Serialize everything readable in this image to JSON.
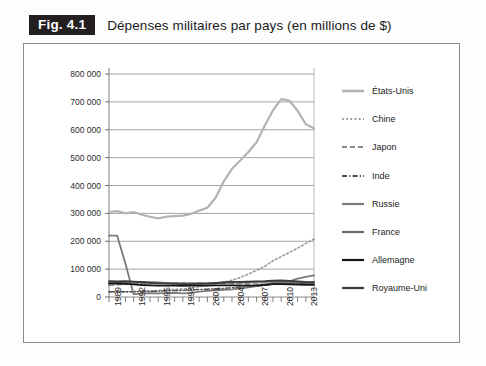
{
  "figure": {
    "badge": "Fig. 4.1",
    "title": "Dépenses militaires par pays (en millions de $)"
  },
  "chart_data": {
    "type": "line",
    "title": "Dépenses militaires par pays (en millions de $)",
    "xlabel": "",
    "ylabel": "",
    "xlim": [
      1989,
      2014
    ],
    "ylim": [
      0,
      800000
    ],
    "grid": true,
    "legend_position": "right",
    "ytick_labels": [
      "800 000",
      "700 000",
      "600 000",
      "500 000",
      "400 000",
      "300 000",
      "200 000",
      "100 000",
      "0"
    ],
    "ytick_values": [
      800000,
      700000,
      600000,
      500000,
      400000,
      300000,
      200000,
      100000,
      0
    ],
    "xtick_labels": [
      "1989",
      "1992",
      "1995",
      "1998",
      "2001",
      "2004",
      "2007",
      "2010",
      "2013"
    ],
    "xtick_values": [
      1989,
      1992,
      1995,
      1998,
      2001,
      2004,
      2007,
      2010,
      2013
    ],
    "x": [
      1989,
      1990,
      1991,
      1992,
      1993,
      1994,
      1995,
      1996,
      1997,
      1998,
      1999,
      2000,
      2001,
      2002,
      2003,
      2004,
      2005,
      2006,
      2007,
      2008,
      2009,
      2010,
      2011,
      2012,
      2013,
      2014
    ],
    "series": [
      {
        "name": "États-Unis",
        "color": "#b3b3b3",
        "style": "solid",
        "width": 2.2,
        "values": [
          305000,
          308000,
          300000,
          305000,
          295000,
          288000,
          282000,
          288000,
          290000,
          292000,
          298000,
          310000,
          320000,
          356000,
          415000,
          460000,
          490000,
          520000,
          555000,
          615000,
          670000,
          710000,
          705000,
          668000,
          620000,
          605000
        ]
      },
      {
        "name": "Chine",
        "color": "#9a9a9a",
        "style": "dotted",
        "width": 1.6,
        "values": [
          17000,
          17500,
          18000,
          19500,
          21000,
          22000,
          23000,
          25000,
          27000,
          29000,
          33000,
          37000,
          42000,
          48000,
          53000,
          60000,
          70000,
          82000,
          96000,
          110000,
          130000,
          145000,
          160000,
          175000,
          192000,
          208000
        ]
      },
      {
        "name": "Japon",
        "color": "#8a8a8a",
        "style": "dashed",
        "width": 1.6,
        "values": [
          42000,
          44000,
          46000,
          47000,
          48000,
          48500,
          49000,
          49500,
          50000,
          50000,
          49500,
          49000,
          48500,
          48500,
          48500,
          48000,
          47500,
          47000,
          46500,
          46000,
          47000,
          47500,
          47000,
          46500,
          46000,
          45500
        ]
      },
      {
        "name": "Inde",
        "color": "#4a4a4a",
        "style": "dashdot",
        "width": 1.4,
        "values": [
          19000,
          19500,
          19000,
          18500,
          20000,
          20000,
          21000,
          22000,
          23000,
          23500,
          26000,
          27000,
          28000,
          30000,
          31000,
          33000,
          35000,
          36000,
          38000,
          42000,
          47000,
          49000,
          49500,
          48000,
          48500,
          50000
        ]
      },
      {
        "name": "Russie",
        "color": "#7a7a7a",
        "style": "solid",
        "width": 1.8,
        "values": [
          220000,
          220000,
          120000,
          10000,
          12000,
          14000,
          13000,
          14000,
          15000,
          13000,
          15000,
          19000,
          22000,
          24000,
          26000,
          27000,
          31000,
          35000,
          40000,
          45000,
          51000,
          52000,
          56000,
          66000,
          72000,
          78000
        ]
      },
      {
        "name": "France",
        "color": "#6e6e6e",
        "style": "solid",
        "width": 1.8,
        "values": [
          52000,
          53000,
          53000,
          54000,
          54000,
          53000,
          52000,
          51000,
          50000,
          49000,
          49000,
          49500,
          50000,
          51000,
          52000,
          53000,
          53000,
          53500,
          54000,
          54000,
          56000,
          55000,
          54000,
          53000,
          52500,
          52000
        ]
      },
      {
        "name": "Allemagne",
        "color": "#151515",
        "style": "solid",
        "width": 1.8,
        "values": [
          48000,
          48500,
          47000,
          45000,
          43000,
          42000,
          41000,
          41000,
          40500,
          40000,
          41000,
          41500,
          41000,
          42000,
          42000,
          41500,
          41000,
          41000,
          41500,
          43000,
          46000,
          46500,
          45000,
          44500,
          44000,
          43500
        ]
      },
      {
        "name": "Royaume-Uni",
        "color": "#3a3a3a",
        "style": "solid",
        "width": 1.8,
        "values": [
          57000,
          56000,
          57000,
          55000,
          53000,
          51000,
          49000,
          48000,
          47000,
          46000,
          46500,
          47000,
          48000,
          50000,
          52000,
          54000,
          54500,
          55000,
          56000,
          57000,
          59000,
          59500,
          58000,
          56000,
          54000,
          53000
        ]
      }
    ]
  },
  "legend": [
    {
      "label": "États-Unis"
    },
    {
      "label": "Chine"
    },
    {
      "label": "Japon"
    },
    {
      "label": "Inde"
    },
    {
      "label": "Russie"
    },
    {
      "label": "France"
    },
    {
      "label": "Allemagne"
    },
    {
      "label": "Royaume-Uni"
    }
  ]
}
